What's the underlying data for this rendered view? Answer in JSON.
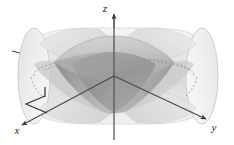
{
  "figure": {
    "background_color": "#ffffff",
    "width": 234,
    "height": 145
  },
  "axes": {
    "x": {
      "label": "x",
      "label_x": 17,
      "label_y": 131,
      "direction": "lower-left",
      "arrow": true
    },
    "y": {
      "label": "y",
      "label_x": 212,
      "label_y": 128,
      "direction": "lower-right",
      "arrow": true
    },
    "z": {
      "label": "z",
      "label_x": 105,
      "label_y": 12,
      "direction": "up",
      "arrow": true
    },
    "origin_x": 114,
    "origin_y": 76,
    "axis_color": "#4a4a4a",
    "axis_width": 1.1
  },
  "annotation": {
    "tick_label": "1",
    "tick_x": 44,
    "tick_y": 92,
    "leader_color": "#2e2e2e"
  },
  "cylinders": [
    {
      "name": "cylinder-along-x",
      "orientation": "along-x-axis",
      "fill": "#e8e8e8",
      "edge": "#bdbdbd"
    },
    {
      "name": "cylinder-along-y",
      "orientation": "along-y-axis",
      "fill": "#ededed",
      "edge": "#c4c4c4"
    }
  ],
  "intersection_solid": {
    "name": "steinmetz-solid",
    "fill_dark": "#9b9b9b",
    "fill_mid": "#b5b5b5",
    "fill_light": "#cfcfcf"
  },
  "hidden_edges": {
    "style": "dashed",
    "color": "#9a9a9a",
    "dash_pattern": "2 2"
  },
  "palette": {
    "lightest": "#f2f2f2",
    "light": "#e4e4e4",
    "mid_light": "#d4d4d4",
    "mid": "#bfbfbf",
    "mid_dark": "#a8a8a8",
    "dark": "#8f8f8f",
    "outline": "#6e6e6e",
    "ink": "#222222"
  }
}
